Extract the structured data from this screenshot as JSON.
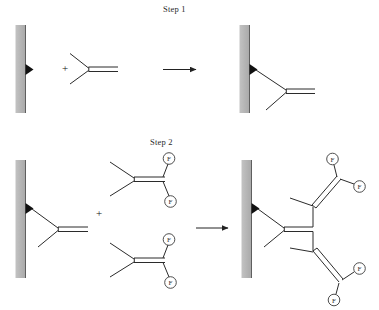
{
  "figure": {
    "background_color": "#ffffff",
    "line_color": "#2b2b2b",
    "surface_color": "#b8b8b8",
    "surface_edge_color": "#6e6e6e",
    "triangle_color": "#111111"
  },
  "steps": [
    {
      "id": "step-1",
      "label": "Step 1",
      "plus_symbol": "+",
      "arrow_symbol": "→",
      "reactants": [
        {
          "name": "surface-with-active-site",
          "type": "gray-bar-with-triangle"
        },
        {
          "name": "isobutylene-monomer",
          "type": "alkene",
          "substituent_labels": []
        }
      ],
      "products": [
        {
          "name": "surface-bound-alkene",
          "type": "gray-bar-with-bound-alkene"
        }
      ]
    },
    {
      "id": "step-2",
      "label": "Step 2",
      "plus_symbol": "+",
      "arrow_symbol": "→",
      "reactants": [
        {
          "name": "surface-bound-alkene",
          "type": "gray-bar-with-bound-alkene"
        },
        {
          "name": "fluorinated-monomer-top",
          "type": "alkene",
          "substituent_labels": [
            "F",
            "F"
          ]
        },
        {
          "name": "fluorinated-monomer-bottom",
          "type": "alkene",
          "substituent_labels": [
            "F",
            "F"
          ]
        }
      ],
      "products": [
        {
          "name": "branched-fluorinated-polymer-on-surface",
          "type": "gray-bar-with-branched-polymer",
          "substituent_labels": [
            "F",
            "F",
            "F",
            "F"
          ]
        }
      ]
    }
  ],
  "labels": {
    "fluorine": "F"
  }
}
